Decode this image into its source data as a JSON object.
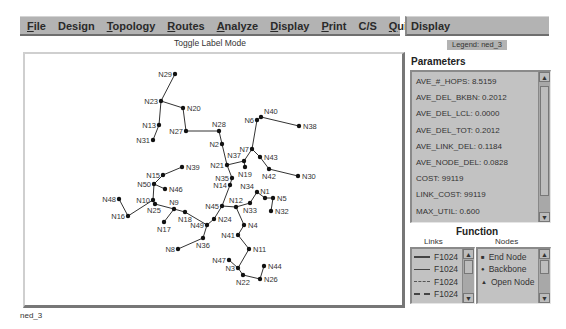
{
  "menubar": {
    "items": [
      {
        "label": "File",
        "mnemonic": "F"
      },
      {
        "label": "Design",
        "mnemonic": ""
      },
      {
        "label": "Topology",
        "mnemonic": "T"
      },
      {
        "label": "Routes",
        "mnemonic": "R"
      },
      {
        "label": "Analyze",
        "mnemonic": "A"
      },
      {
        "label": "Display",
        "mnemonic": "D"
      },
      {
        "label": "Print",
        "mnemonic": "P"
      },
      {
        "label": "C/S",
        "mnemonic": ""
      },
      {
        "label": "Quit",
        "mnemonic": "Q"
      }
    ]
  },
  "canvas": {
    "mode_label": "Toggle Label Mode"
  },
  "side_panel": {
    "title": "Display",
    "legend_badge": "Legend: ned_3",
    "parameters_title": "Parameters",
    "parameters": [
      "AVE_#_HOPS: 8.5159",
      "AVE_DEL_BKBN: 0.2012",
      "AVE_DEL_LCL: 0.0000",
      "AVE_DEL_TOT: 0.2012",
      "AVE_LINK_DEL: 0.1184",
      "AVE_NODE_DEL: 0.0828",
      "COST: 99119",
      "LINK_COST: 99119",
      "MAX_UTIL: 0.600"
    ],
    "function_title": "Function",
    "links_title": "Links",
    "nodes_title": "Nodes",
    "links": [
      {
        "style": "thick-solid",
        "label": "F1024"
      },
      {
        "style": "solid",
        "label": "F1024"
      },
      {
        "style": "dash-dot",
        "label": "F1024"
      },
      {
        "style": "dashed",
        "label": "F1024"
      }
    ],
    "nodes": [
      {
        "icon": "square",
        "label": "End Node"
      },
      {
        "icon": "circle",
        "label": "Backbone"
      },
      {
        "icon": "triangle",
        "label": "Open Node"
      }
    ]
  },
  "status_text": "ned_3",
  "network": {
    "nodes": [
      {
        "id": "N29",
        "x": 175,
        "y": 74,
        "lx": -2,
        "label_side": "left"
      },
      {
        "id": "N23",
        "x": 161,
        "y": 101,
        "label_side": "left"
      },
      {
        "id": "N20",
        "x": 183,
        "y": 108,
        "label_side": "right"
      },
      {
        "id": "N13",
        "x": 159,
        "y": 125,
        "label_side": "left"
      },
      {
        "id": "N31",
        "x": 153,
        "y": 140,
        "label_side": "left"
      },
      {
        "id": "N27",
        "x": 186,
        "y": 131,
        "label_side": "left"
      },
      {
        "id": "N28",
        "x": 219,
        "y": 131,
        "label_side": "above"
      },
      {
        "id": "N2",
        "x": 222,
        "y": 144,
        "label_side": "left"
      },
      {
        "id": "N6",
        "x": 257,
        "y": 120,
        "label_side": "left"
      },
      {
        "id": "N40",
        "x": 261,
        "y": 117,
        "label_side": "above-right"
      },
      {
        "id": "N38",
        "x": 299,
        "y": 126,
        "label_side": "right"
      },
      {
        "id": "N7",
        "x": 252,
        "y": 149,
        "label_side": "left"
      },
      {
        "id": "N43",
        "x": 260,
        "y": 157,
        "label_side": "right"
      },
      {
        "id": "N37",
        "x": 244,
        "y": 161,
        "label_side": "above-left"
      },
      {
        "id": "N21",
        "x": 227,
        "y": 165,
        "label_side": "left"
      },
      {
        "id": "N19",
        "x": 245,
        "y": 167,
        "label_side": "below"
      },
      {
        "id": "N42",
        "x": 269,
        "y": 169,
        "label_side": "below"
      },
      {
        "id": "N30",
        "x": 298,
        "y": 176,
        "label_side": "right"
      },
      {
        "id": "N35",
        "x": 232,
        "y": 178,
        "label_side": "left"
      },
      {
        "id": "N14",
        "x": 230,
        "y": 185,
        "label_side": "left"
      },
      {
        "id": "N34",
        "x": 257,
        "y": 192,
        "label_side": "above-left"
      },
      {
        "id": "N1",
        "x": 265,
        "y": 198,
        "label_side": "above"
      },
      {
        "id": "N5",
        "x": 273,
        "y": 198,
        "label_side": "right"
      },
      {
        "id": "N32",
        "x": 271,
        "y": 211,
        "label_side": "right"
      },
      {
        "id": "N33",
        "x": 250,
        "y": 203,
        "label_side": "below"
      },
      {
        "id": "N12",
        "x": 236,
        "y": 207,
        "label_side": "above"
      },
      {
        "id": "N45",
        "x": 222,
        "y": 206,
        "label_side": "left"
      },
      {
        "id": "N4",
        "x": 244,
        "y": 225,
        "label_side": "right"
      },
      {
        "id": "N24",
        "x": 214,
        "y": 219,
        "label_side": "right"
      },
      {
        "id": "N41",
        "x": 238,
        "y": 235,
        "label_side": "left"
      },
      {
        "id": "N11",
        "x": 249,
        "y": 249,
        "label_side": "right"
      },
      {
        "id": "N47",
        "x": 229,
        "y": 260,
        "label_side": "left"
      },
      {
        "id": "N3",
        "x": 238,
        "y": 268,
        "label_side": "left"
      },
      {
        "id": "N44",
        "x": 264,
        "y": 266,
        "label_side": "right"
      },
      {
        "id": "N22",
        "x": 243,
        "y": 275,
        "label_side": "below"
      },
      {
        "id": "N26",
        "x": 260,
        "y": 279,
        "label_side": "right"
      },
      {
        "id": "N39",
        "x": 182,
        "y": 167,
        "label_side": "right"
      },
      {
        "id": "N15",
        "x": 163,
        "y": 175,
        "label_side": "left"
      },
      {
        "id": "N50",
        "x": 154,
        "y": 184,
        "label_side": "left"
      },
      {
        "id": "N46",
        "x": 165,
        "y": 189,
        "label_side": "right"
      },
      {
        "id": "N48",
        "x": 119,
        "y": 199,
        "label_side": "left"
      },
      {
        "id": "N10",
        "x": 153,
        "y": 200,
        "label_side": "left"
      },
      {
        "id": "N25",
        "x": 155,
        "y": 204,
        "label_side": "below-left"
      },
      {
        "id": "N9",
        "x": 174,
        "y": 209,
        "label_side": "above"
      },
      {
        "id": "N18",
        "x": 185,
        "y": 212,
        "label_side": "below"
      },
      {
        "id": "N16",
        "x": 128,
        "y": 216,
        "label_side": "left"
      },
      {
        "id": "N17",
        "x": 164,
        "y": 222,
        "label_side": "below"
      },
      {
        "id": "N49",
        "x": 207,
        "y": 225,
        "label_side": "left"
      },
      {
        "id": "N36",
        "x": 203,
        "y": 238,
        "label_side": "below"
      },
      {
        "id": "N8",
        "x": 178,
        "y": 249,
        "label_side": "left"
      }
    ],
    "links": [
      [
        "N29",
        "N23"
      ],
      [
        "N23",
        "N13"
      ],
      [
        "N13",
        "N31"
      ],
      [
        "N23",
        "N20"
      ],
      [
        "N20",
        "N27"
      ],
      [
        "N27",
        "N28"
      ],
      [
        "N28",
        "N2"
      ],
      [
        "N2",
        "N21"
      ],
      [
        "N21",
        "N37"
      ],
      [
        "N37",
        "N19"
      ],
      [
        "N37",
        "N7"
      ],
      [
        "N7",
        "N6"
      ],
      [
        "N6",
        "N40"
      ],
      [
        "N40",
        "N38"
      ],
      [
        "N7",
        "N43"
      ],
      [
        "N43",
        "N42"
      ],
      [
        "N42",
        "N30"
      ],
      [
        "N21",
        "N35"
      ],
      [
        "N35",
        "N14"
      ],
      [
        "N14",
        "N45"
      ],
      [
        "N45",
        "N12"
      ],
      [
        "N12",
        "N33"
      ],
      [
        "N33",
        "N34"
      ],
      [
        "N34",
        "N1"
      ],
      [
        "N1",
        "N5"
      ],
      [
        "N5",
        "N32"
      ],
      [
        "N12",
        "N4"
      ],
      [
        "N4",
        "N41"
      ],
      [
        "N41",
        "N11"
      ],
      [
        "N11",
        "N3"
      ],
      [
        "N3",
        "N47"
      ],
      [
        "N3",
        "N22"
      ],
      [
        "N22",
        "N26"
      ],
      [
        "N26",
        "N44"
      ],
      [
        "N45",
        "N24"
      ],
      [
        "N24",
        "N49"
      ],
      [
        "N49",
        "N18"
      ],
      [
        "N18",
        "N9"
      ],
      [
        "N9",
        "N17"
      ],
      [
        "N9",
        "N25"
      ],
      [
        "N25",
        "N10"
      ],
      [
        "N10",
        "N50"
      ],
      [
        "N50",
        "N15"
      ],
      [
        "N15",
        "N39"
      ],
      [
        "N50",
        "N46"
      ],
      [
        "N10",
        "N16"
      ],
      [
        "N16",
        "N48"
      ],
      [
        "N49",
        "N36"
      ],
      [
        "N36",
        "N8"
      ]
    ]
  }
}
